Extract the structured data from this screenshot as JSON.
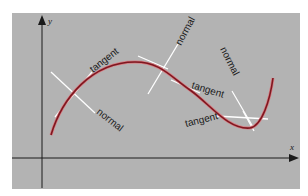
{
  "diagram": {
    "type": "curve-with-tangents-and-normals",
    "colors": {
      "background": "#b3b3b3",
      "curve": "#8a1c24",
      "curve_highlight": "#d87a80",
      "lines": "#ffffff",
      "axes": "#1a1a1a"
    },
    "axes": {
      "x_label": "x",
      "y_label": "y"
    },
    "annotations": [
      {
        "id": "tangent-1",
        "text": "tangent"
      },
      {
        "id": "normal-1",
        "text": "normal"
      },
      {
        "id": "normal-2",
        "text": "normal"
      },
      {
        "id": "tangent-2",
        "text": "tangent"
      },
      {
        "id": "normal-3",
        "text": "normal"
      },
      {
        "id": "tangent-3",
        "text": "tangent"
      }
    ]
  }
}
